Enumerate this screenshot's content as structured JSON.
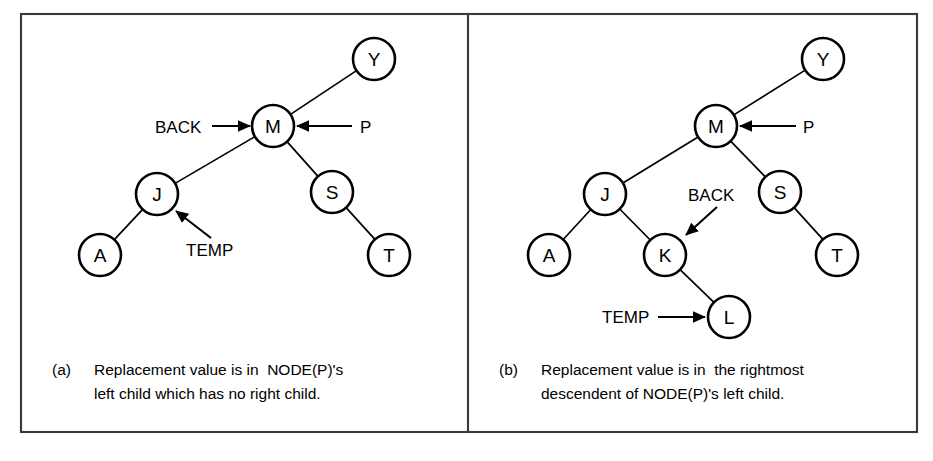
{
  "figure": {
    "background": "#ffffff",
    "line_color": "#000000",
    "frame_color": "#3a3a3a",
    "frame": {
      "x": 21,
      "y": 14,
      "width": 896,
      "height": 418
    },
    "divider_x": 468
  },
  "panels": [
    {
      "id": "panel-a",
      "caption_marker": "(a)",
      "caption_line1": "Replacement value is in  NODE(P)'s",
      "caption_line2": "left child which has no right child.",
      "caption_x": 52,
      "caption_y1": 375,
      "caption_y2": 399,
      "caption_indent": 42,
      "nodes": [
        {
          "label": "Y",
          "cx": 374,
          "cy": 59,
          "r": 21
        },
        {
          "label": "M",
          "cx": 273,
          "cy": 126,
          "r": 21
        },
        {
          "label": "J",
          "cx": 157,
          "cy": 194,
          "r": 21
        },
        {
          "label": "S",
          "cx": 332,
          "cy": 192,
          "r": 21
        },
        {
          "label": "A",
          "cx": 100,
          "cy": 255,
          "r": 21
        },
        {
          "label": "T",
          "cx": 389,
          "cy": 255,
          "r": 21
        }
      ],
      "edges": [
        {
          "from": "M",
          "to": "Y"
        },
        {
          "from": "M",
          "to": "J"
        },
        {
          "from": "M",
          "to": "S"
        },
        {
          "from": "J",
          "to": "A"
        },
        {
          "from": "S",
          "to": "T"
        }
      ],
      "pointers": [
        {
          "name": "BACK",
          "label": "BACK",
          "label_x": 155,
          "label_y": 133,
          "anchor": "start",
          "arrow": {
            "x1": 212,
            "y1": 126,
            "x2": 250,
            "y2": 126
          },
          "target": "M"
        },
        {
          "name": "P",
          "label": "P",
          "label_x": 360,
          "label_y": 133,
          "anchor": "start",
          "arrow": {
            "x1": 352,
            "y1": 126,
            "x2": 297,
            "y2": 126
          },
          "target": "M"
        },
        {
          "name": "TEMP",
          "label": "TEMP",
          "label_x": 186,
          "label_y": 256,
          "anchor": "start",
          "arrow": {
            "x1": 211,
            "y1": 238,
            "x2": 176,
            "y2": 211
          },
          "target": "J"
        }
      ]
    },
    {
      "id": "panel-b",
      "caption_marker": "(b)",
      "caption_line1": "Replacement value is in  the rightmost",
      "caption_line2": "descendent of NODE(P)'s left child.",
      "caption_x": 499,
      "caption_y1": 375,
      "caption_y2": 399,
      "caption_indent": 42,
      "nodes": [
        {
          "label": "Y",
          "cx": 823,
          "cy": 59,
          "r": 21
        },
        {
          "label": "M",
          "cx": 716,
          "cy": 126,
          "r": 21
        },
        {
          "label": "J",
          "cx": 605,
          "cy": 194,
          "r": 21
        },
        {
          "label": "S",
          "cx": 780,
          "cy": 192,
          "r": 21
        },
        {
          "label": "A",
          "cx": 549,
          "cy": 255,
          "r": 21
        },
        {
          "label": "K",
          "cx": 665,
          "cy": 255,
          "r": 21
        },
        {
          "label": "T",
          "cx": 837,
          "cy": 255,
          "r": 21
        },
        {
          "label": "L",
          "cx": 729,
          "cy": 317,
          "r": 21
        }
      ],
      "edges": [
        {
          "from": "M",
          "to": "Y"
        },
        {
          "from": "M",
          "to": "J"
        },
        {
          "from": "M",
          "to": "S"
        },
        {
          "from": "J",
          "to": "A"
        },
        {
          "from": "J",
          "to": "K"
        },
        {
          "from": "K",
          "to": "L"
        },
        {
          "from": "S",
          "to": "T"
        }
      ],
      "pointers": [
        {
          "name": "P",
          "label": "P",
          "label_x": 803,
          "label_y": 133,
          "anchor": "start",
          "arrow": {
            "x1": 796,
            "y1": 126,
            "x2": 740,
            "y2": 126
          },
          "target": "M"
        },
        {
          "name": "BACK",
          "label": "BACK",
          "label_x": 688,
          "label_y": 201,
          "anchor": "start",
          "arrow": {
            "x1": 717,
            "y1": 207,
            "x2": 686,
            "y2": 235
          },
          "target": "K"
        },
        {
          "name": "TEMP",
          "label": "TEMP",
          "label_x": 602,
          "label_y": 323,
          "anchor": "start",
          "arrow": {
            "x1": 658,
            "y1": 317,
            "x2": 705,
            "y2": 317
          },
          "target": "L"
        }
      ]
    }
  ]
}
